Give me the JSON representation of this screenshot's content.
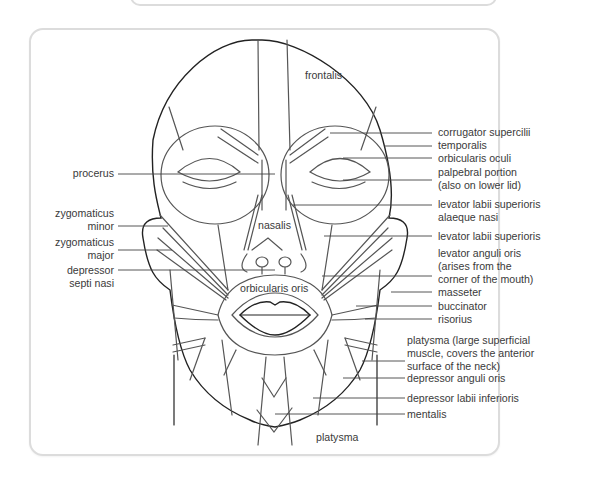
{
  "diagram": {
    "inner_labels": {
      "frontalis": "frontalis",
      "nasalis": "nasalis",
      "orbicularis_oris": "orbicularis oris",
      "platysma_bottom": "platysma"
    },
    "left_labels": [
      {
        "id": "procerus",
        "lines": [
          "procerus"
        ]
      },
      {
        "id": "zygomaticus-minor",
        "lines": [
          "zygomaticus",
          "minor"
        ]
      },
      {
        "id": "zygomaticus-major",
        "lines": [
          "zygomaticus",
          "major"
        ]
      },
      {
        "id": "depressor-septi-nasi",
        "lines": [
          "depressor",
          "septi nasi"
        ]
      }
    ],
    "right_labels": [
      {
        "id": "corrugator-supercilii",
        "lines": [
          "corrugator supercilii"
        ]
      },
      {
        "id": "temporalis",
        "lines": [
          "temporalis"
        ]
      },
      {
        "id": "orbicularis-oculi",
        "lines": [
          "orbicularis oculi"
        ]
      },
      {
        "id": "palpebral-portion",
        "lines": [
          "palpebral portion",
          "(also on lower lid)"
        ]
      },
      {
        "id": "levator-labii-superioris-alaeque-nasi",
        "lines": [
          "levator labii superioris",
          "alaeque nasi"
        ]
      },
      {
        "id": "levator-labii-superioris",
        "lines": [
          "levator labii superioris"
        ]
      },
      {
        "id": "levator-anguli-oris",
        "lines": [
          "levator anguli oris",
          "(arises from the",
          "corner of the mouth)"
        ]
      },
      {
        "id": "masseter",
        "lines": [
          "masseter"
        ]
      },
      {
        "id": "buccinator",
        "lines": [
          "buccinator"
        ]
      },
      {
        "id": "risorius",
        "lines": [
          "risorius"
        ]
      },
      {
        "id": "platysma",
        "lines": [
          "platysma (large superficial",
          "muscle, covers the anterior",
          "surface of the neck)"
        ]
      },
      {
        "id": "depressor-anguli-oris",
        "lines": [
          "depressor anguli oris"
        ]
      },
      {
        "id": "depressor-labii-inferioris",
        "lines": [
          "depressor labii inferioris"
        ]
      },
      {
        "id": "mentalis",
        "lines": [
          "mentalis"
        ]
      }
    ],
    "colors": {
      "outline": "#222222",
      "muscle_line": "#555555",
      "card_border": "#dcdcdc",
      "text": "#3a3a3a"
    }
  }
}
